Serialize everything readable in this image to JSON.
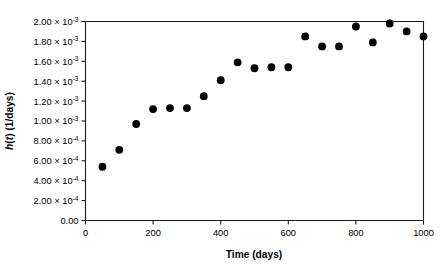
{
  "chart_data": {
    "type": "scatter",
    "title": "",
    "xlabel": "Time (days)",
    "ylabel": "h(t) (1/days)",
    "xlim": [
      0,
      1000
    ],
    "ylim": [
      0,
      0.002
    ],
    "grid": false,
    "legend": null,
    "x": [
      50,
      100,
      150,
      200,
      250,
      300,
      350,
      400,
      450,
      500,
      550,
      600,
      650,
      700,
      750,
      800,
      850,
      900,
      950,
      1000
    ],
    "values": [
      0.00054,
      0.00071,
      0.00097,
      0.00112,
      0.00113,
      0.00113,
      0.00125,
      0.00141,
      0.00159,
      0.00153,
      0.00154,
      0.00154,
      0.00185,
      0.00175,
      0.00175,
      0.00195,
      0.00179,
      0.00198,
      0.0019,
      0.00185
    ],
    "x_ticks": [
      0,
      200,
      400,
      600,
      800,
      1000
    ],
    "x_tick_labels": [
      "0",
      "200",
      "400",
      "600",
      "800",
      "1000"
    ],
    "y_ticks": [
      0,
      0.0002,
      0.0004,
      0.0006,
      0.0008,
      0.001,
      0.0012,
      0.0014,
      0.0016,
      0.0018,
      0.002
    ],
    "y_tick_labels": [
      {
        "mantissa": "0.00",
        "times": "",
        "base": "",
        "exp": ""
      },
      {
        "mantissa": "2.00",
        "times": "×",
        "base": "10",
        "exp": "-4"
      },
      {
        "mantissa": "4.00",
        "times": "×",
        "base": "10",
        "exp": "-4"
      },
      {
        "mantissa": "6.00",
        "times": "×",
        "base": "10",
        "exp": "-4"
      },
      {
        "mantissa": "8.00",
        "times": "×",
        "base": "10",
        "exp": "-4"
      },
      {
        "mantissa": "1.00",
        "times": "×",
        "base": "10",
        "exp": "-3"
      },
      {
        "mantissa": "1.20",
        "times": "×",
        "base": "10",
        "exp": "-3"
      },
      {
        "mantissa": "1.40",
        "times": "×",
        "base": "10",
        "exp": "-3"
      },
      {
        "mantissa": "1.60",
        "times": "×",
        "base": "10",
        "exp": "-3"
      },
      {
        "mantissa": "1.80",
        "times": "×",
        "base": "10",
        "exp": "-3"
      },
      {
        "mantissa": "2.00",
        "times": "×",
        "base": "10",
        "exp": "-3"
      }
    ],
    "marker": "filled-circle",
    "marker_color": "#000000",
    "marker_size": 4.6,
    "ylabel_parts": {
      "italic": "h",
      "rest_a": "(",
      "italic_b": "t",
      "rest_b": ") (1/days)"
    }
  }
}
